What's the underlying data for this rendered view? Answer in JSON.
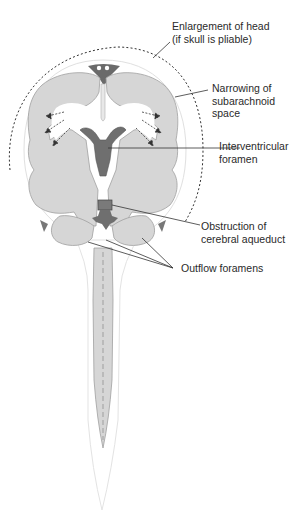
{
  "figure": {
    "colors": {
      "brain_fill": "#d6d6d6",
      "brain_outline": "#9a9a9a",
      "ventricle_dark": "#6f6f6f",
      "obstruction": "#7a7a7a",
      "leader_line": "#333333",
      "dotted_outline": "#333333",
      "background": "#ffffff"
    }
  },
  "labels": [
    {
      "id": "enlargement",
      "text": "Enlargement of head\n(if skull is pliable)"
    },
    {
      "id": "narrowing",
      "text": "Narrowing of\nsubarachnoid\nspace"
    },
    {
      "id": "interventricular",
      "text": "Interventricular\nforamen"
    },
    {
      "id": "obstruction",
      "text": "Obstruction of\ncerebral aqueduct"
    },
    {
      "id": "outflow",
      "text": "Outflow foramens"
    }
  ]
}
